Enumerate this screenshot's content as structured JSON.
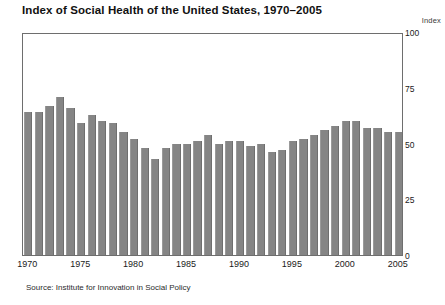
{
  "chart_data": {
    "type": "bar",
    "title": "Index of Social Health of the United States, 1970–2005",
    "xlabel": "",
    "ylabel": "Index",
    "ylim": [
      0,
      100
    ],
    "yticks": [
      0,
      25,
      50,
      75,
      100
    ],
    "xticks": [
      "1970",
      "1975",
      "1980",
      "1985",
      "1990",
      "1995",
      "2000",
      "2005"
    ],
    "grid": false,
    "legend": null,
    "source": "Source: Institute for Innovation in Social Policy",
    "bar_color": "#858585",
    "categories": [
      "1970",
      "1971",
      "1972",
      "1973",
      "1974",
      "1975",
      "1976",
      "1977",
      "1978",
      "1979",
      "1980",
      "1981",
      "1982",
      "1983",
      "1984",
      "1985",
      "1986",
      "1987",
      "1988",
      "1989",
      "1990",
      "1991",
      "1992",
      "1993",
      "1994",
      "1995",
      "1996",
      "1997",
      "1998",
      "1999",
      "2000",
      "2001",
      "2002",
      "2003",
      "2004",
      "2005"
    ],
    "values": [
      64,
      64,
      67,
      71,
      66,
      59,
      63,
      60,
      59,
      55,
      52,
      48,
      43,
      48,
      50,
      50,
      51,
      54,
      50,
      51,
      51,
      49,
      50,
      46,
      47,
      51,
      52,
      54,
      56,
      58,
      60,
      60,
      57,
      57,
      55,
      55
    ]
  },
  "axis_unit_label": "Index"
}
